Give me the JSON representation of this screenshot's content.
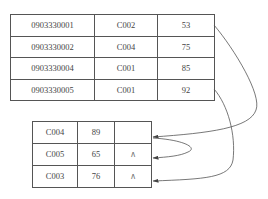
{
  "main_table": {
    "rows": [
      {
        "id": "0903330001",
        "course": "C002",
        "score": "53"
      },
      {
        "id": "0903330002",
        "course": "C004",
        "score": "75"
      },
      {
        "id": "0903330004",
        "course": "C001",
        "score": "85"
      },
      {
        "id": "0903330005",
        "course": "C001",
        "score": "92"
      }
    ]
  },
  "overflow_table": {
    "rows": [
      {
        "course": "C004",
        "score": "89",
        "pointer": ""
      },
      {
        "course": "C005",
        "score": "65",
        "pointer": "∧"
      },
      {
        "course": "C003",
        "score": "76",
        "pointer": "∧"
      }
    ]
  },
  "links": [
    {
      "from": "main_table.rows.0",
      "to": "overflow_table.rows.0"
    },
    {
      "from": "overflow_table.rows.0",
      "to": "overflow_table.rows.1"
    },
    {
      "from": "main_table.rows.3",
      "to": "overflow_table.rows.2"
    }
  ],
  "colors": {
    "line": "#555555",
    "text": "#444444"
  }
}
